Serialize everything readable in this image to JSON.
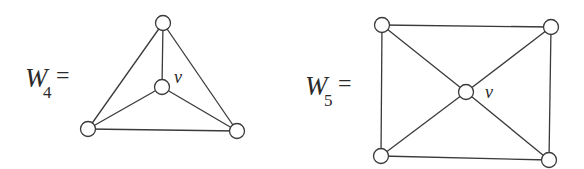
{
  "diagram": {
    "colors": {
      "stroke": "#3a3a3a",
      "node_fill": "#ffffff",
      "text": "#2a2a2a",
      "background": "#ffffff"
    },
    "graphs": [
      {
        "id": "W4",
        "label": {
          "main": "W",
          "sub": "4",
          "eq": "="
        },
        "hub_label": "v",
        "nodes": [
          {
            "id": "top",
            "x": 163,
            "y": 23
          },
          {
            "id": "v",
            "x": 162,
            "y": 87
          },
          {
            "id": "bl",
            "x": 88,
            "y": 129
          },
          {
            "id": "br",
            "x": 237,
            "y": 131
          }
        ],
        "edges": [
          [
            "top",
            "v"
          ],
          [
            "top",
            "bl"
          ],
          [
            "top",
            "br"
          ],
          [
            "bl",
            "br"
          ],
          [
            "v",
            "bl"
          ],
          [
            "v",
            "br"
          ]
        ]
      },
      {
        "id": "W5",
        "label": {
          "main": "W",
          "sub": "5",
          "eq": "="
        },
        "hub_label": "v",
        "nodes": [
          {
            "id": "tl",
            "x": 382,
            "y": 25
          },
          {
            "id": "tr",
            "x": 551,
            "y": 27
          },
          {
            "id": "v",
            "x": 466,
            "y": 92
          },
          {
            "id": "bl",
            "x": 381,
            "y": 156
          },
          {
            "id": "br",
            "x": 549,
            "y": 160
          }
        ],
        "edges": [
          [
            "tl",
            "tr"
          ],
          [
            "tr",
            "br"
          ],
          [
            "br",
            "bl"
          ],
          [
            "bl",
            "tl"
          ],
          [
            "v",
            "tl"
          ],
          [
            "v",
            "tr"
          ],
          [
            "v",
            "bl"
          ],
          [
            "v",
            "br"
          ]
        ]
      }
    ]
  }
}
